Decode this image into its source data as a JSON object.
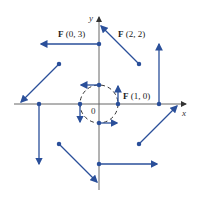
{
  "diagram": {
    "type": "vector_field",
    "field": "F(x, y) = (-y, x)",
    "axes": {
      "x_label": "x",
      "y_label": "y",
      "origin_label": "0"
    },
    "labels": [
      {
        "bold": "F",
        "args": "(0, 3)"
      },
      {
        "bold": "F",
        "args": "(2, 2)"
      },
      {
        "bold": "F",
        "args": "(1, 0)"
      }
    ],
    "colors": {
      "vector": "#2a4f9a",
      "axis": "#555555",
      "circle": "#333333"
    },
    "points": [
      [
        0,
        3
      ],
      [
        2,
        2
      ],
      [
        3,
        0
      ],
      [
        2,
        -2
      ],
      [
        0,
        -3
      ],
      [
        -2,
        -2
      ],
      [
        -3,
        0
      ],
      [
        -2,
        2
      ],
      [
        1,
        0
      ],
      [
        0,
        1
      ],
      [
        -1,
        0
      ],
      [
        0,
        -1
      ]
    ]
  }
}
